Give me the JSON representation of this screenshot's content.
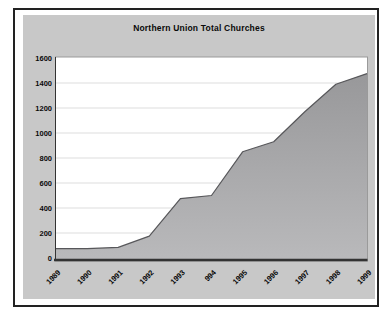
{
  "chart_data": {
    "type": "area",
    "title": "Northern Union Total Churches",
    "categories": [
      "1989",
      "1990",
      "1991",
      "1992",
      "1993",
      "994",
      "1995",
      "1996",
      "1997",
      "1998",
      "1999"
    ],
    "values": [
      75,
      75,
      85,
      175,
      475,
      500,
      850,
      930,
      1170,
      1390,
      1475
    ],
    "xlabel": "",
    "ylabel": "",
    "ylim": [
      0,
      1600
    ],
    "yticks": [
      0,
      200,
      400,
      600,
      800,
      1000,
      1200,
      1400,
      1600
    ],
    "grid": "horizontal",
    "legend": "none",
    "x_label_rotation_deg": 45,
    "series_name": "Total Churches"
  },
  "style": {
    "page_background": "#ffffff",
    "frame_border": "#222222",
    "chart_background": "#c8c8c8",
    "plot_background": "#ffffff",
    "plot_border": "#9a9a9a",
    "gridline": "#dddddd",
    "axis_line": "#333333",
    "area_fill_top": "#98989a",
    "area_fill_bottom": "#b9b9bb",
    "area_stroke": "#57575a",
    "text_color": "#0a0a0a"
  }
}
